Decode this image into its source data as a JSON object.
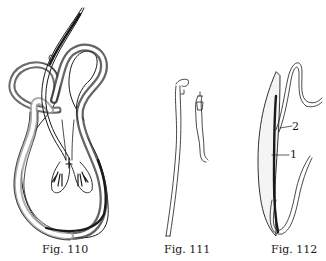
{
  "plate": {
    "figures": [
      {
        "id": "110",
        "caption": "Fig. 110",
        "subject": "coiled worm pair with spicule detail"
      },
      {
        "id": "111",
        "caption": "Fig. 111",
        "subject": "two slender worms, line drawing"
      },
      {
        "id": "112",
        "caption": "Fig. 112",
        "subject": "large worm with smaller worm attached",
        "callouts": [
          "1",
          "2"
        ]
      }
    ],
    "colors": {
      "ink": "#1a1a1a",
      "shading": "#3a3a3a",
      "paper": "#ffffff",
      "stipple": "#9a9a9a"
    }
  }
}
